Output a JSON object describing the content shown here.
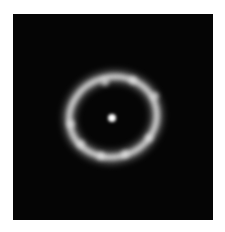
{
  "image": {
    "subject": "einstein-ring",
    "background_color": "#050505",
    "page_background": "#ffffff",
    "ring": {
      "cx": 100,
      "cy": 103,
      "rx": 44,
      "ry": 40,
      "rotation": -15,
      "color": "#e6e6e6"
    },
    "core": {
      "cx": 99,
      "cy": 104,
      "r": 4,
      "color": "#ffffff"
    },
    "knots": [
      {
        "cx": 92,
        "cy": 68
      },
      {
        "cx": 120,
        "cy": 66
      },
      {
        "cx": 142,
        "cy": 82
      },
      {
        "cx": 58,
        "cy": 110
      },
      {
        "cx": 68,
        "cy": 130
      },
      {
        "cx": 88,
        "cy": 142
      },
      {
        "cx": 112,
        "cy": 140
      },
      {
        "cx": 136,
        "cy": 124
      }
    ]
  }
}
